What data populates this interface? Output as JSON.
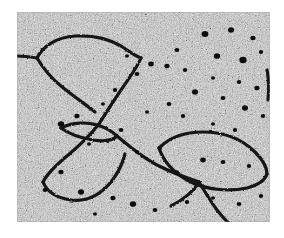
{
  "page": {
    "background_color": "#ffffff"
  },
  "micrograph": {
    "label": "electron-micrograph",
    "modality": "transmission electron microscopy",
    "subject": "spread DNA / chromatin filaments with branch junctions and loops",
    "color_mode": "grayscale",
    "frame": {
      "left": 17,
      "top": 12,
      "width": 253,
      "height": 210
    },
    "colors": {
      "background_light": "#d6d6d6",
      "background_mid": "#b0b0b0",
      "grain_dark": "#4a4a4a",
      "filament": "#141414",
      "stain_particle": "#0c0c0c",
      "page": "#ffffff"
    },
    "features": {
      "filament_count": 9,
      "loop_count": 4,
      "junction_count": 3,
      "stain_particle_count": 46,
      "filament_stroke_width": 3.2
    },
    "filaments": [
      {
        "name": "upper-left-loop",
        "d": "M 20 46 C 26 34 40 25 58 24 C 76 23 92 27 104 34 C 112 39 118 44 124 46"
      },
      {
        "name": "upper-left-loop-lower-arc",
        "d": "M 20 46 C 26 56 34 66 44 74 C 56 84 68 92 78 100"
      },
      {
        "name": "left-edge-strand",
        "d": "M 0 44 C 8 44 14 45 20 46"
      },
      {
        "name": "central-descender",
        "d": "M 124 46 C 120 56 112 66 104 78 C 96 90 88 102 82 112"
      },
      {
        "name": "mid-left-small-loop-top",
        "d": "M 44 116 C 56 110 70 110 80 113 C 90 116 96 120 100 124"
      },
      {
        "name": "mid-left-small-loop-bottom",
        "d": "M 44 116 C 52 122 64 126 76 128 C 88 130 96 128 100 124"
      },
      {
        "name": "lower-left-loop-upper",
        "d": "M 82 112 C 74 122 62 134 50 144 C 38 154 30 162 26 170"
      },
      {
        "name": "lower-left-loop-lower",
        "d": "M 26 170 C 30 180 40 186 54 188 C 70 190 84 182 94 170 C 102 160 106 150 108 142"
      },
      {
        "name": "central-junction-to-right",
        "d": "M 100 124 C 112 134 126 146 142 154 C 156 161 170 166 182 170"
      },
      {
        "name": "right-large-loop-upper",
        "d": "M 142 136 C 152 126 168 120 186 120 C 208 120 226 128 238 140 C 246 148 250 156 250 162"
      },
      {
        "name": "right-large-loop-lower",
        "d": "M 142 136 C 146 148 156 160 170 168 C 188 178 212 180 230 176 C 242 173 248 168 250 162"
      },
      {
        "name": "lower-right-tail",
        "d": "M 182 170 C 188 180 194 190 200 198 C 206 206 212 212 218 216"
      },
      {
        "name": "lower-mid-branch",
        "d": "M 182 170 C 176 180 166 188 154 194"
      },
      {
        "name": "right-edge-fragment",
        "d": "M 250 58 C 252 68 252 78 251 88"
      }
    ],
    "stain_particles": [
      {
        "cx": 188,
        "cy": 22,
        "r": 3.4
      },
      {
        "cx": 214,
        "cy": 18,
        "r": 3.0
      },
      {
        "cx": 236,
        "cy": 26,
        "r": 2.6
      },
      {
        "cx": 160,
        "cy": 38,
        "r": 2.4
      },
      {
        "cx": 200,
        "cy": 44,
        "r": 3.2
      },
      {
        "cx": 226,
        "cy": 48,
        "r": 3.6
      },
      {
        "cx": 244,
        "cy": 40,
        "r": 2.2
      },
      {
        "cx": 134,
        "cy": 52,
        "r": 2.8
      },
      {
        "cx": 150,
        "cy": 54,
        "r": 2.6
      },
      {
        "cx": 168,
        "cy": 58,
        "r": 2.2
      },
      {
        "cx": 110,
        "cy": 44,
        "r": 2.0
      },
      {
        "cx": 120,
        "cy": 62,
        "r": 2.4
      },
      {
        "cx": 196,
        "cy": 66,
        "r": 2.0
      },
      {
        "cx": 222,
        "cy": 70,
        "r": 2.2
      },
      {
        "cx": 240,
        "cy": 76,
        "r": 2.6
      },
      {
        "cx": 178,
        "cy": 80,
        "r": 3.0
      },
      {
        "cx": 206,
        "cy": 86,
        "r": 2.4
      },
      {
        "cx": 98,
        "cy": 78,
        "r": 2.2
      },
      {
        "cx": 86,
        "cy": 92,
        "r": 2.0
      },
      {
        "cx": 152,
        "cy": 92,
        "r": 2.4
      },
      {
        "cx": 228,
        "cy": 96,
        "r": 3.0
      },
      {
        "cx": 246,
        "cy": 104,
        "r": 2.2
      },
      {
        "cx": 130,
        "cy": 100,
        "r": 2.0
      },
      {
        "cx": 166,
        "cy": 104,
        "r": 2.2
      },
      {
        "cx": 60,
        "cy": 104,
        "r": 2.6
      },
      {
        "cx": 44,
        "cy": 112,
        "r": 3.2
      },
      {
        "cx": 104,
        "cy": 118,
        "r": 2.4
      },
      {
        "cx": 196,
        "cy": 112,
        "r": 2.0
      },
      {
        "cx": 218,
        "cy": 118,
        "r": 2.2
      },
      {
        "cx": 72,
        "cy": 132,
        "r": 2.0
      },
      {
        "cx": 120,
        "cy": 140,
        "r": 2.2
      },
      {
        "cx": 186,
        "cy": 148,
        "r": 2.8
      },
      {
        "cx": 206,
        "cy": 150,
        "r": 2.4
      },
      {
        "cx": 232,
        "cy": 154,
        "r": 2.2
      },
      {
        "cx": 160,
        "cy": 160,
        "r": 2.0
      },
      {
        "cx": 44,
        "cy": 160,
        "r": 2.6
      },
      {
        "cx": 28,
        "cy": 178,
        "r": 2.4
      },
      {
        "cx": 64,
        "cy": 180,
        "r": 3.0
      },
      {
        "cx": 96,
        "cy": 186,
        "r": 2.6
      },
      {
        "cx": 116,
        "cy": 192,
        "r": 3.2
      },
      {
        "cx": 138,
        "cy": 198,
        "r": 2.4
      },
      {
        "cx": 170,
        "cy": 190,
        "r": 2.2
      },
      {
        "cx": 196,
        "cy": 186,
        "r": 2.0
      },
      {
        "cx": 222,
        "cy": 192,
        "r": 2.4
      },
      {
        "cx": 244,
        "cy": 184,
        "r": 2.2
      },
      {
        "cx": 78,
        "cy": 202,
        "r": 2.0
      }
    ]
  }
}
